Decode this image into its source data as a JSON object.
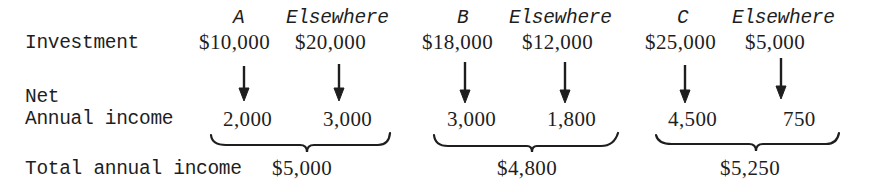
{
  "headers": [
    {
      "label": "A"
    },
    {
      "label": "Elsewhere"
    },
    {
      "label": "B"
    },
    {
      "label": "Elsewhere"
    },
    {
      "label": "C"
    },
    {
      "label": "Elsewhere"
    }
  ],
  "rows": {
    "investment": {
      "label": "Investment",
      "values": [
        "$10,000",
        "$20,000",
        "$18,000",
        "$12,000",
        "$25,000",
        "$5,000"
      ]
    },
    "net_income": {
      "label_line1": "Net",
      "label_line2": "Annual income",
      "values": [
        "2,000",
        "3,000",
        "3,000",
        "1,800",
        "4,500",
        "750"
      ]
    },
    "total": {
      "label": "Total annual income",
      "values": [
        "$5,000",
        "$4,800",
        "$5,250"
      ]
    }
  },
  "icons": {
    "arrow": "down-arrow",
    "brace": "curly-brace-under"
  },
  "colors": {
    "ink": "#1e1e1e",
    "background": "#ffffff"
  }
}
